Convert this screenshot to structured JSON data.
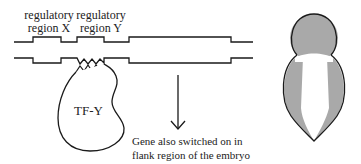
{
  "labels": {
    "region_x_line1": "regulatory",
    "region_x_line2": "region X",
    "region_y_line1": "regulatory",
    "region_y_line2": "region Y",
    "tf": "TF-Y",
    "caption_line1": "Gene also switched on in",
    "caption_line2": "flank region of the embryo"
  },
  "colors": {
    "stroke": "#1a1a1a",
    "shaded": "#a9a9a9",
    "background": "#ffffff"
  }
}
